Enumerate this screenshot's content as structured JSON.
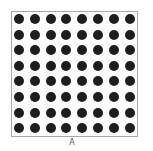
{
  "figure": {
    "label": "A",
    "grid": {
      "rows": 8,
      "cols": 8,
      "dot_color": "#1e1e1e",
      "border_color": "#a8a8a8"
    }
  }
}
